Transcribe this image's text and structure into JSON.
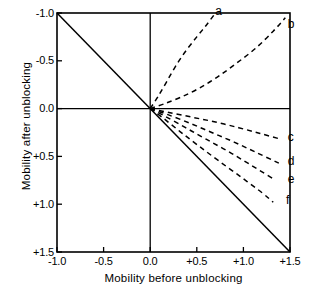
{
  "chart_data": {
    "type": "line",
    "title": "",
    "xlabel": "Mobility before unblocking",
    "ylabel": "Mobility after unblocking",
    "xlim": [
      -1.0,
      1.5
    ],
    "ylim": [
      1.5,
      -1.0
    ],
    "y_axis_inverted": true,
    "grid": false,
    "legend": "inline-curve-labels",
    "xticks": [
      "-1.0",
      "-0.5",
      "0.0",
      "+0.5",
      "+1.0",
      "+1.5"
    ],
    "xtick_values": [
      -1.0,
      -0.5,
      0.0,
      0.5,
      1.0,
      1.5
    ],
    "yticks": [
      "-1.0",
      "-0.5",
      "0.0",
      "+0.5",
      "+1.0",
      "+1.5"
    ],
    "ytick_values": [
      -1.0,
      -0.5,
      0.0,
      0.5,
      1.0,
      1.5
    ],
    "axis_lines": [
      {
        "name": "vertical-zero-axis",
        "x": 0.0
      },
      {
        "name": "horizontal-zero-axis",
        "y": 0.0
      }
    ],
    "series": [
      {
        "name": "identity-reversal-line",
        "label": "",
        "style": "solid",
        "points": [
          [
            -1.0,
            -1.0
          ],
          [
            1.5,
            1.5
          ]
        ]
      },
      {
        "name": "a",
        "label": "a",
        "style": "dashed",
        "label_pos": [
          0.74,
          -1.02
        ],
        "points": [
          [
            0.0,
            0.0
          ],
          [
            0.08,
            -0.12
          ],
          [
            0.17,
            -0.27
          ],
          [
            0.27,
            -0.44
          ],
          [
            0.38,
            -0.6
          ],
          [
            0.5,
            -0.75
          ],
          [
            0.6,
            -0.87
          ],
          [
            0.7,
            -1.0
          ]
        ]
      },
      {
        "name": "b",
        "label": "b",
        "style": "dashed",
        "label_pos": [
          1.52,
          -0.88
        ],
        "points": [
          [
            0.0,
            0.0
          ],
          [
            0.15,
            -0.05
          ],
          [
            0.33,
            -0.12
          ],
          [
            0.52,
            -0.21
          ],
          [
            0.72,
            -0.33
          ],
          [
            0.92,
            -0.47
          ],
          [
            1.13,
            -0.63
          ],
          [
            1.32,
            -0.81
          ],
          [
            1.45,
            -0.95
          ]
        ]
      },
      {
        "name": "c",
        "label": "c",
        "style": "dashed",
        "label_pos": [
          1.52,
          0.3
        ],
        "points": [
          [
            0.0,
            0.0
          ],
          [
            0.2,
            0.04
          ],
          [
            0.45,
            0.09
          ],
          [
            0.7,
            0.14
          ],
          [
            0.95,
            0.2
          ],
          [
            1.18,
            0.26
          ],
          [
            1.4,
            0.32
          ]
        ]
      },
      {
        "name": "d",
        "label": "d",
        "style": "dashed",
        "label_pos": [
          1.52,
          0.55
        ],
        "points": [
          [
            0.0,
            0.0
          ],
          [
            0.18,
            0.06
          ],
          [
            0.42,
            0.15
          ],
          [
            0.66,
            0.25
          ],
          [
            0.9,
            0.35
          ],
          [
            1.14,
            0.46
          ],
          [
            1.38,
            0.57
          ]
        ]
      },
      {
        "name": "e",
        "label": "e",
        "style": "dashed",
        "label_pos": [
          1.52,
          0.74
        ],
        "points": [
          [
            0.0,
            0.0
          ],
          [
            0.16,
            0.08
          ],
          [
            0.38,
            0.2
          ],
          [
            0.6,
            0.32
          ],
          [
            0.84,
            0.45
          ],
          [
            1.08,
            0.59
          ],
          [
            1.33,
            0.74
          ]
        ]
      },
      {
        "name": "f",
        "label": "f",
        "style": "dashed",
        "label_pos": [
          1.5,
          0.96
        ],
        "points": [
          [
            0.0,
            0.0
          ],
          [
            0.14,
            0.1
          ],
          [
            0.32,
            0.24
          ],
          [
            0.52,
            0.39
          ],
          [
            0.74,
            0.55
          ],
          [
            0.98,
            0.72
          ],
          [
            1.2,
            0.88
          ],
          [
            1.32,
            0.98
          ]
        ]
      }
    ]
  }
}
